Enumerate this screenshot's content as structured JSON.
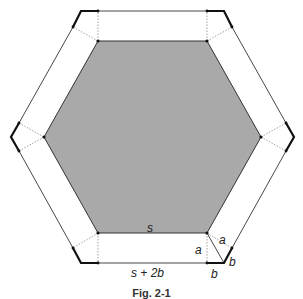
{
  "diagram": {
    "inner_fill": "#a9a9a9",
    "line_color": "#333333",
    "thick_color": "#111111",
    "dotted_color": "#999999",
    "inner_hexagon": [
      [
        98,
        41
      ],
      [
        207,
        41
      ],
      [
        261,
        137
      ],
      [
        207,
        233
      ],
      [
        98,
        233
      ],
      [
        44,
        137
      ]
    ],
    "outer_hexagon": [
      [
        81,
        11
      ],
      [
        224,
        11
      ],
      [
        294,
        137
      ],
      [
        224,
        263
      ],
      [
        81,
        263
      ],
      [
        11,
        137
      ]
    ],
    "labels": {
      "s": "s",
      "s_plus_2b": "s + 2b",
      "a_vertical": "a",
      "a_diagonal": "a",
      "b_bottom": "b",
      "b_diagonal": "b"
    },
    "caption": "Fig. 2-1"
  }
}
